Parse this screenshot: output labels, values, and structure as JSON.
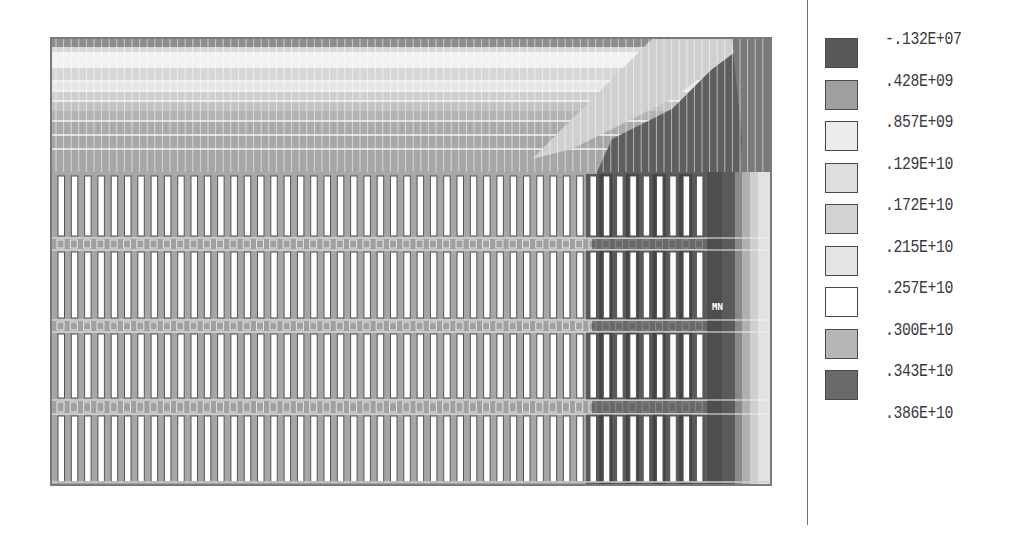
{
  "chart_data": {
    "type": "heatmap",
    "title": "",
    "xlabel": "",
    "ylabel": "",
    "legend_position": "right",
    "grid": false,
    "annotations": [
      "MN"
    ],
    "contour_levels": [
      {
        "value": "-.132E+07",
        "color": "#5a5a5a"
      },
      {
        "value": ".428E+09",
        "color": "#9c9c9c"
      },
      {
        "value": ".857E+09",
        "color": "#e8e8e8"
      },
      {
        "value": ".129E+10",
        "color": "#dcdcdc"
      },
      {
        "value": ".172E+10",
        "color": "#d0d0d0"
      },
      {
        "value": ".215E+10",
        "color": "#e0e0e0"
      },
      {
        "value": ".257E+10",
        "color": "#ffffff"
      },
      {
        "value": ".300E+10",
        "color": "#b4b4b4"
      },
      {
        "value": ".343E+10",
        "color": "#6c6c6c"
      },
      {
        "value": ".386E+10",
        "color": null
      }
    ],
    "numeric_levels": [
      -1320000,
      428000000,
      857000000,
      1290000000,
      1720000000,
      2150000000,
      2570000000,
      3000000000,
      3430000000,
      3860000000
    ]
  },
  "plot": {
    "min_marker_label": "MN",
    "slot_rows": 4,
    "slots_per_row": 46
  },
  "legend": {
    "items": [
      {
        "label": "-.132E+07",
        "color": "#585858"
      },
      {
        "label": ".428E+09",
        "color": "#a0a0a0"
      },
      {
        "label": ".857E+09",
        "color": "#ececec"
      },
      {
        "label": ".129E+10",
        "color": "#dedede"
      },
      {
        "label": ".172E+10",
        "color": "#d2d2d2"
      },
      {
        "label": ".215E+10",
        "color": "#e4e4e4"
      },
      {
        "label": ".257E+10",
        "color": "#ffffff"
      },
      {
        "label": ".300E+10",
        "color": "#b6b6b6"
      },
      {
        "label": ".343E+10",
        "color": "#6a6a6a"
      },
      {
        "label": ".386E+10",
        "color": null
      }
    ]
  }
}
